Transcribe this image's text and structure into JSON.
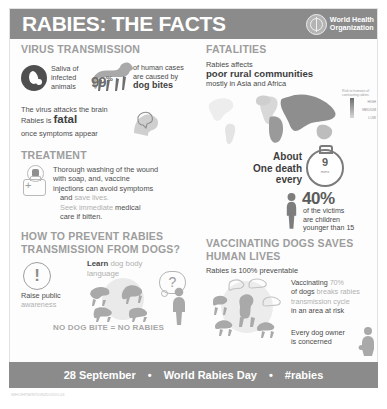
{
  "header": {
    "title": "RABIES: THE FACTS",
    "logo_line1": "World Health",
    "logo_line2": "Organization",
    "logo_icon": "who-emblem-icon",
    "bg_color": "#8b8b8b"
  },
  "virus_transmission": {
    "heading": "VIRUS TRANSMISSION",
    "saliva_icon": "blood-drop-icon",
    "saliva_text": "Saliva of infected animals",
    "dog_icon": "dog-silhouette-icon",
    "percent": "99",
    "percent_symbol": "%",
    "percent_caption_line1": "of human cases",
    "percent_caption_line2": "are caused by",
    "percent_caption_bold": "dog bites",
    "brain_icon": "brain-head-icon",
    "brain_line1": "The virus attacks the brain",
    "brain_line2_pre": "Rabies is",
    "brain_line2_bold": "fatal",
    "brain_line3": "once symptoms appear"
  },
  "treatment": {
    "heading": "TREATMENT",
    "vial_icon": "vaccine-vial-icon",
    "medkit_icon": "medical-kit-icon",
    "line1": "Thorough washing of the wound",
    "line2": "with soap, and,  vaccine",
    "line3": "injections can avoid symptoms",
    "line4_pre": "and",
    "line4_grey": "save lives.",
    "line5_grey": "Seek immediate",
    "line5_post": "medical",
    "line6": "care if bitten."
  },
  "prevent": {
    "heading_line1": "HOW TO PREVENT RABIES",
    "heading_line2": "TRANSMISSION FROM DOGS?",
    "exclamation_icon": "exclamation-circle-icon",
    "awareness_line1": "Raise public",
    "awareness_line2_grey": "awareness",
    "learn_bold": "Learn",
    "learn_grey": "dog body language",
    "question_icon": "question-bubble-icon",
    "question_mark": "?",
    "dogs_icon": "dog-pack-icon",
    "person_icon": "person-silhouette-icon",
    "tagline": "NO DOG BITE = NO RABIES"
  },
  "fatalities": {
    "heading": "FATALITIES",
    "line1": "Rabies affects",
    "line2_bold": "poor rural communities",
    "line3": "mostly in Asia and Africa",
    "map_icon": "world-map-icon",
    "legend_title": "Risk to humans of contracting rabies",
    "legend_high": "HIGH",
    "legend_medium": "MEDIUM",
    "legend_low": "LOW",
    "death_line1": "About",
    "death_line2": "One death",
    "death_line3": "every",
    "stopwatch_icon": "stopwatch-icon",
    "stopwatch_value": "9",
    "stopwatch_unit": "mins",
    "child_icon": "child-silhouette-icon",
    "victims_percent": "40%",
    "victims_line1": "of the victims",
    "victims_line2": "are children",
    "victims_line3": "younger than 15"
  },
  "vaccinating": {
    "heading_line1": "VACCINATING DOGS SAVES",
    "heading_line2": "HUMAN LIVES",
    "subheading": "Rabies is 100% preventable",
    "dogs_circle_icon": "dog-circle-icon",
    "line1_pre": "Vaccinating",
    "line1_grey": "70%",
    "line2_pre": "of dogs",
    "line2_grey": "breaks rabies",
    "line3_grey": "transmission cycle",
    "line4": "in an area at risk",
    "owner_line1": "Every dog owner",
    "owner_line2": "is concerned",
    "owner_icon": "dog-owner-icon"
  },
  "footer": {
    "date": "28 September",
    "sep1": "•",
    "event": "World Rabies Day",
    "sep2": "•",
    "hashtag": "#rabies",
    "bg_color": "#8b8b8b"
  },
  "credit": {
    "text": "WHO/HTM/NTD/NZD/2015.01"
  }
}
